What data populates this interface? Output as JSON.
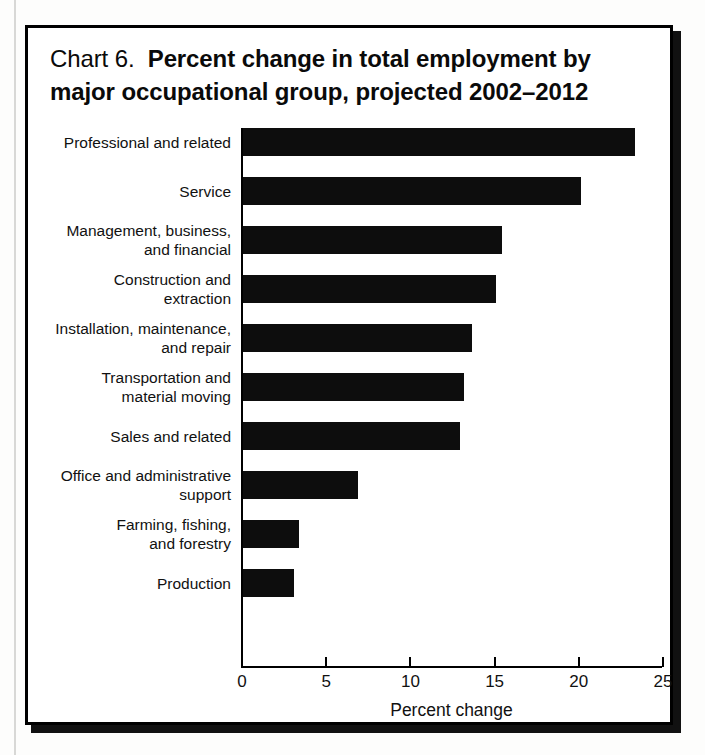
{
  "chart_data": {
    "type": "bar",
    "orientation": "horizontal",
    "title_prefix": "Chart 6.",
    "title_main": "Percent change in total employment by major occupational group, projected 2002–2012",
    "xlabel": "Percent change",
    "ylabel": "",
    "xlim": [
      0,
      25
    ],
    "xticks": [
      0,
      5,
      10,
      15,
      20,
      25
    ],
    "xtick_labels": [
      "0",
      "5",
      "10",
      "15",
      "20",
      "25"
    ],
    "grid": false,
    "legend": null,
    "bar_color": "#0d0d0d",
    "categories": [
      "Professional and related",
      "Service",
      "Management, business, and financial",
      "Construction and extraction",
      "Installation, maintenance, and repair",
      "Transportation and material moving",
      "Sales and related",
      "Office and administrative support",
      "Farming, fishing, and forestry",
      "Production"
    ],
    "category_lines": [
      [
        "Professional and related"
      ],
      [
        "Service"
      ],
      [
        "Management, business,",
        "and financial"
      ],
      [
        "Construction and",
        "extraction"
      ],
      [
        "Installation, maintenance,",
        "and repair"
      ],
      [
        "Transportation and",
        "material moving"
      ],
      [
        "Sales and related"
      ],
      [
        "Office and administrative",
        "support"
      ],
      [
        "Farming, fishing,",
        "and forestry"
      ],
      [
        "Production"
      ]
    ],
    "values": [
      23.3,
      20.1,
      15.4,
      15.0,
      13.6,
      13.1,
      12.9,
      6.8,
      3.3,
      3.0
    ]
  }
}
